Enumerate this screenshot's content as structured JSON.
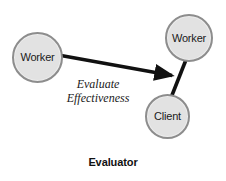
{
  "diagram": {
    "caption": "Evaluator",
    "background_color": "#ffffff",
    "node_fill_color": "#e2e2e2",
    "node_border_color": "#8d8d8d",
    "edge_color": "#111111",
    "nodes": [
      {
        "id": "worker-left",
        "label": "Worker",
        "shape": "circle"
      },
      {
        "id": "worker-right",
        "label": "Worker",
        "shape": "circle"
      },
      {
        "id": "client",
        "label": "Client",
        "shape": "circle"
      }
    ],
    "edges": [
      {
        "id": "evaluate-arrow",
        "from": "worker-left",
        "to": "worker-right",
        "style": "arrow",
        "label_line1": "Evaluate",
        "label_line2": "Effectiveness"
      },
      {
        "id": "worker-client-link",
        "from": "worker-right",
        "to": "client",
        "style": "line",
        "label_line1": "",
        "label_line2": ""
      }
    ]
  }
}
